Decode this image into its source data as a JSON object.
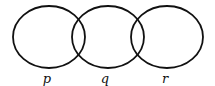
{
  "diagram": {
    "type": "venn-chain",
    "stroke_color": "#111111",
    "circles": [
      {
        "label": "p",
        "cx": 49,
        "cy": 37,
        "rx": 36,
        "ry": 31
      },
      {
        "label": "q",
        "cx": 108,
        "cy": 37,
        "rx": 36,
        "ry": 31
      },
      {
        "label": "r",
        "cx": 167,
        "cy": 37,
        "rx": 36,
        "ry": 31
      }
    ],
    "labels": [
      {
        "text": "p",
        "x": 47,
        "y": 72
      },
      {
        "text": "q",
        "x": 105,
        "y": 72
      },
      {
        "text": "r",
        "x": 165,
        "y": 72
      }
    ]
  }
}
